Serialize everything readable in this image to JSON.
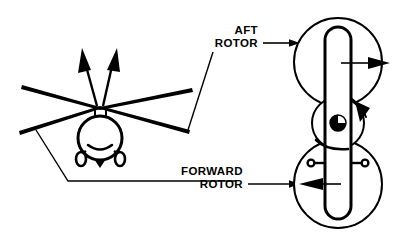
{
  "figure": {
    "background_color": "#ffffff",
    "line_color": "#000000",
    "width": 403,
    "height": 236
  },
  "labels": {
    "aft_rotor": {
      "line1": "AFT",
      "line2": "ROTOR"
    },
    "forward_rotor": {
      "line1": "FORWARD",
      "line2": "ROTOR"
    }
  },
  "helicopter": {
    "name": "top-view helicopter silhouette",
    "parts": [
      "fuselage-oval",
      "rotor-blades",
      "cockpit-arc",
      "nose-triangle",
      "landing-gear-left",
      "landing-gear-right",
      "thrust-arrow-left",
      "thrust-arrow-right"
    ]
  },
  "rotor_discs": {
    "aft": {
      "name": "aft rotor disc",
      "blade_orientation": "vertical",
      "blade_cap": "top",
      "arrow_direction": "right"
    },
    "forward": {
      "name": "forward rotor disc",
      "blade_orientation": "vertical",
      "blade_cap": "bottom",
      "arrow_direction": "left",
      "stub_marks": 2
    },
    "hub": {
      "name": "rotor hub",
      "symbol": "quartered-circle",
      "rotation_arrow": "clockwise"
    }
  },
  "leader_lines": {
    "aft": "diagonal from AFT ROTOR text down-left to right blade tip",
    "forward": "from left blade tip down then horizontally right to FORWARD ROTOR text",
    "aft_pointer": "horizontal arrow from AFT ROTOR text right into aft rotor disc",
    "forward_pointer": "horizontal arrow from FORWARD ROTOR text right into forward rotor disc"
  }
}
